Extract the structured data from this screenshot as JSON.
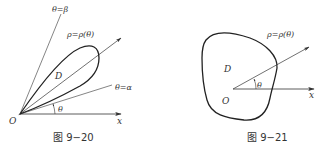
{
  "figures": [
    {
      "id": "fig-9-20",
      "caption": "图 9−20",
      "labels": {
        "theta_beta": "θ=β",
        "theta_alpha": "θ=α",
        "rho_curve": "ρ=ρ(θ)",
        "region": "D",
        "angle": "θ",
        "origin": "O",
        "x_axis": "x"
      }
    },
    {
      "id": "fig-9-21",
      "caption": "图 9−21",
      "labels": {
        "rho_curve": "ρ=ρ(θ)",
        "region": "D",
        "angle": "θ",
        "origin": "O",
        "x_axis": "x"
      }
    }
  ],
  "colors": {
    "stroke": "#333333",
    "background": "#ffffff"
  }
}
